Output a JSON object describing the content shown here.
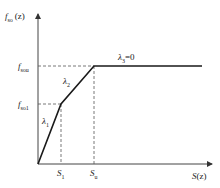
{
  "diagram": {
    "type": "piecewise-linear curve",
    "y_axis_label": "f",
    "y_axis_label_sub": "so",
    "y_axis_label_arg": "(z)",
    "x_axis_label": "S",
    "x_axis_label_arg": "(z)",
    "y_ticks": [
      {
        "main": "f",
        "sub": "sou"
      },
      {
        "main": "f",
        "sub": "so1"
      }
    ],
    "x_ticks": [
      {
        "main": "S",
        "sub": "1"
      },
      {
        "main": "S",
        "sub": "u"
      }
    ],
    "segment_labels": [
      {
        "main": "λ",
        "sub": "1",
        "suffix": ""
      },
      {
        "main": "λ",
        "sub": "2",
        "suffix": ""
      },
      {
        "main": "λ",
        "sub": "3",
        "suffix": "=0"
      }
    ],
    "colors": {
      "line": "#1a1a1a",
      "dashed": "#555555"
    }
  }
}
